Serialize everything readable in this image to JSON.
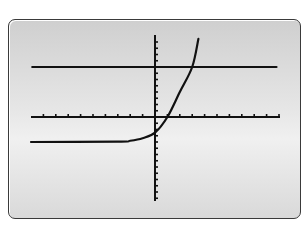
{
  "chart_data": {
    "type": "line",
    "title": "",
    "xlabel": "",
    "ylabel": "",
    "grid": false,
    "legend": "none",
    "xlim": [
      -10,
      10
    ],
    "ylim": [
      -13,
      13
    ],
    "x_tick_step": 1,
    "y_tick_step": 1,
    "series": [
      {
        "name": "exponential curve",
        "description": "exponential growth curve with horizontal asymptote near y = -4, y-intercept near -2.5, x-intercept near 1",
        "points": [
          [
            -10,
            -4
          ],
          [
            -3,
            -3.95
          ],
          [
            -2,
            -3.8
          ],
          [
            -1,
            -3.4
          ],
          [
            0,
            -2.5
          ],
          [
            1,
            0
          ],
          [
            2,
            4
          ],
          [
            3,
            8
          ],
          [
            3.5,
            12.5
          ]
        ]
      },
      {
        "name": "horizontal line",
        "description": "horizontal line y = 8",
        "points": [
          [
            -9.9,
            8
          ],
          [
            9.8,
            8
          ]
        ]
      }
    ],
    "pixel_geometry": {
      "origin": [
        155,
        117
      ],
      "px_per_x_unit": 12.4,
      "px_per_y_unit": 6.25,
      "x_axis": [
        31,
        280
      ],
      "y_axis": [
        35,
        201
      ],
      "horizontal_line_y": 67,
      "asymptote_y": 142
    }
  }
}
